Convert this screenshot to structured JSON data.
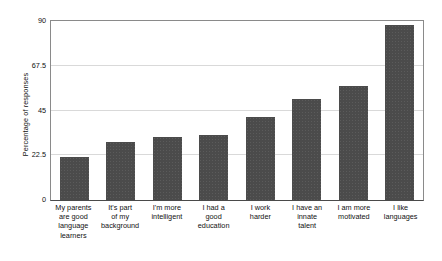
{
  "chart_data": {
    "type": "bar",
    "title": "",
    "xlabel": "",
    "ylabel": "Percentage of responses",
    "ylim": [
      0,
      90
    ],
    "yticks": [
      "0",
      "22.5",
      "45",
      "67.5",
      "90"
    ],
    "ytick_values": [
      0,
      22.5,
      45,
      67.5,
      90
    ],
    "grid": true,
    "legend": "none",
    "bar_color": "#4b4b4b",
    "categories": [
      "My parents are good language learners",
      "It's part of my background",
      "I'm more intelligent",
      "I had a good education",
      "I work harder",
      "I have an innate talent",
      "I am more motivated",
      "I like languages"
    ],
    "category_lines": [
      [
        "My parents",
        "are good",
        "language",
        "learners"
      ],
      [
        "It's part",
        "of my",
        "background"
      ],
      [
        "I'm more",
        "intelligent"
      ],
      [
        "I had a",
        "good",
        "education"
      ],
      [
        "I work",
        "harder"
      ],
      [
        "I have an",
        "innate",
        "talent"
      ],
      [
        "I am more",
        "motivated"
      ],
      [
        "I like",
        "languages"
      ]
    ],
    "values": [
      21.5,
      29,
      31.5,
      32.5,
      41.5,
      51,
      57.5,
      88
    ]
  }
}
